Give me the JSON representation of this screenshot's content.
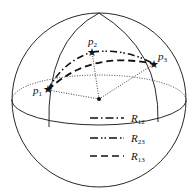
{
  "diagram": {
    "type": "sphere-geodesic",
    "points": [
      {
        "id": "p1",
        "label": "p",
        "sub": "1"
      },
      {
        "id": "p2",
        "label": "p",
        "sub": "2"
      },
      {
        "id": "p3",
        "label": "p",
        "sub": "3"
      }
    ],
    "legend": [
      {
        "id": "R12",
        "label": "R",
        "sub": "12",
        "style": "dash-dot"
      },
      {
        "id": "R23",
        "label": "R",
        "sub": "23",
        "style": "dash-dot-dot"
      },
      {
        "id": "R13",
        "label": "R",
        "sub": "13",
        "style": "dashed"
      }
    ],
    "colors": {
      "stroke": "#111111",
      "background": "#ffffff"
    }
  }
}
